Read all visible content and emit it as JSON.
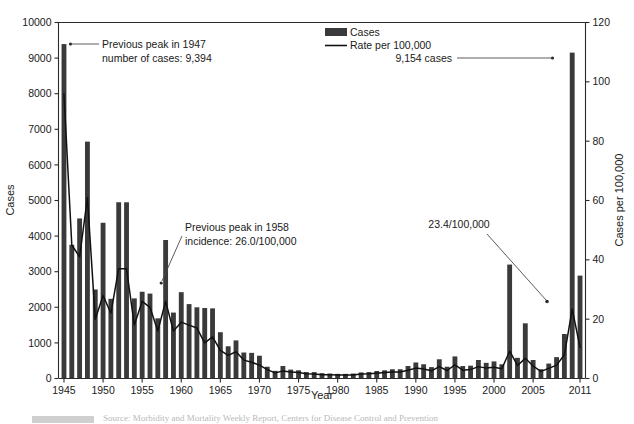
{
  "chart_data": {
    "type": "bar",
    "title": "",
    "xlabel": "Year",
    "ylabel": "Cases",
    "y2label": "Cases per 100,000",
    "ylim": [
      0,
      10000
    ],
    "y2lim": [
      0,
      120
    ],
    "xlim": [
      1944.3,
      2011.7
    ],
    "grid": false,
    "legend_position": "top-center-right",
    "yticks": [
      0,
      1000,
      2000,
      3000,
      4000,
      5000,
      6000,
      7000,
      8000,
      9000,
      10000
    ],
    "yticklabels": [
      "0",
      "1000",
      "2000",
      "3000",
      "4000",
      "5000",
      "6000",
      "7000",
      "8000",
      "9000",
      "10000"
    ],
    "y2ticks": [
      0,
      20,
      40,
      60,
      80,
      100,
      120
    ],
    "y2ticklabels": [
      "0",
      "20",
      "40",
      "60",
      "80",
      "100",
      "120"
    ],
    "xticks": [
      1945,
      1950,
      1955,
      1960,
      1965,
      1970,
      1975,
      1980,
      1985,
      1990,
      1995,
      2000,
      2005,
      2011
    ],
    "xticklabels": [
      "1945",
      "1950",
      "1955",
      "1960",
      "1965",
      "1970",
      "1975",
      "1980",
      "1985",
      "1990",
      "1995",
      "2000",
      "2005",
      "2011"
    ],
    "x": [
      1945,
      1946,
      1947,
      1948,
      1949,
      1950,
      1951,
      1952,
      1953,
      1954,
      1955,
      1956,
      1957,
      1958,
      1959,
      1960,
      1961,
      1962,
      1963,
      1964,
      1965,
      1966,
      1967,
      1968,
      1969,
      1970,
      1971,
      1972,
      1973,
      1974,
      1975,
      1976,
      1977,
      1978,
      1979,
      1980,
      1981,
      1982,
      1983,
      1984,
      1985,
      1986,
      1987,
      1988,
      1989,
      1990,
      1991,
      1992,
      1993,
      1994,
      1995,
      1996,
      1997,
      1998,
      1999,
      2000,
      2001,
      2002,
      2003,
      2004,
      2005,
      2006,
      2007,
      2008,
      2009,
      2010,
      2011
    ],
    "series": [
      {
        "name": "Cases",
        "type": "bar",
        "axis": "left",
        "units": "cases",
        "values": [
          9394,
          3756,
          4496,
          6654,
          2500,
          4374,
          2238,
          4951,
          4950,
          2250,
          2437,
          2385,
          1690,
          3890,
          1852,
          2425,
          2090,
          2000,
          1980,
          1970,
          1300,
          905,
          1070,
          730,
          720,
          640,
          330,
          215,
          350,
          250,
          230,
          180,
          180,
          150,
          140,
          130,
          130,
          140,
          170,
          180,
          210,
          230,
          260,
          260,
          350,
          450,
          400,
          320,
          540,
          330,
          620,
          350,
          360,
          520,
          440,
          480,
          400,
          3200,
          580,
          1550,
          520,
          260,
          420,
          600,
          1250,
          9154,
          2890
        ]
      },
      {
        "name": "Rate per 100,000",
        "type": "line",
        "axis": "right",
        "units": "per 100,000",
        "values": [
          96.0,
          45.0,
          41.0,
          61.0,
          20.0,
          28.0,
          22.0,
          37.0,
          37.0,
          18.0,
          26.0,
          24.0,
          16.0,
          26.0,
          16.0,
          19.0,
          18.0,
          17.0,
          12.0,
          14.0,
          9.5,
          7.8,
          9.0,
          6.2,
          5.5,
          4.5,
          3.0,
          1.9,
          2.5,
          2.2,
          2.0,
          1.6,
          1.5,
          1.3,
          1.3,
          1.2,
          1.2,
          1.2,
          1.5,
          1.6,
          1.8,
          2.0,
          2.2,
          2.2,
          2.8,
          3.5,
          3.2,
          2.6,
          4.0,
          2.7,
          4.6,
          2.8,
          3.0,
          4.0,
          3.5,
          3.8,
          3.3,
          9.2,
          4.4,
          6.8,
          4.2,
          2.4,
          3.4,
          4.5,
          8.0,
          23.4,
          10.5
        ]
      }
    ],
    "annotations": [
      {
        "id": "peak-1947",
        "lines": [
          "Previous peak in 1947",
          "number of cases: 9,394"
        ],
        "target_year": 1945,
        "target_value": 9394,
        "note_value": "9,394"
      },
      {
        "id": "peak-1958",
        "lines": [
          "Previous peak in 1958",
          "incidence: 26.0/100,000"
        ],
        "target_year": 1958,
        "target_value": 26.0,
        "note_value": "26.0/100,000"
      },
      {
        "id": "cases-2010",
        "lines": [
          "9,154 cases"
        ],
        "target_year": 2010,
        "target_value": 9154,
        "note_value": "9,154"
      },
      {
        "id": "rate-2010",
        "lines": [
          "23.4/100,000"
        ],
        "target_year": 2010,
        "target_value": 23.4,
        "note_value": "23.4/100,000"
      }
    ],
    "colors": {
      "bar": "#3a3a3a",
      "line": "#111111",
      "axis": "#2b2b2b",
      "background": "#ffffff"
    }
  },
  "legend": {
    "items": [
      {
        "label": "Cases",
        "marker": "bar-swatch"
      },
      {
        "label": "Rate per 100,000",
        "marker": "line-swatch"
      }
    ]
  },
  "axes": {
    "x_title": "Year",
    "y_left_title": "Cases",
    "y_right_title": "Cases per 100,000"
  },
  "annotation_text": {
    "peak1947_line1": "Previous peak in 1947",
    "peak1947_line2": "number of cases: 9,394",
    "peak1958_line1": "Previous peak in 1958",
    "peak1958_line2": "incidence: 26.0/100,000",
    "cases2010": "9,154 cases",
    "rate2010": "23.4/100,000"
  },
  "caption": {
    "text": "Source: Morbidity and Mortality Weekly Report, Centers for Disease Control and Prevention"
  }
}
